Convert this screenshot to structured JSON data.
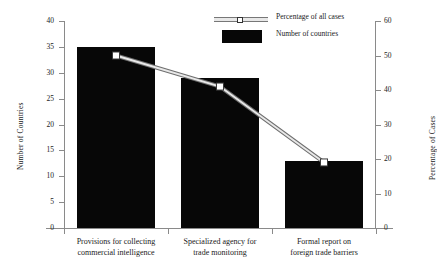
{
  "chart_data": {
    "type": "bar",
    "title": "",
    "subtitle": "",
    "xlabel": "",
    "ylabel": "Number of Countries",
    "y2label": "Percentage of Cases",
    "categories": [
      "Provisions for collecting commercial intelligence",
      "Specialized agency for trade monitoring",
      "Formal report on foreign trade barriers"
    ],
    "category_lines": [
      [
        "Provisions for collecting",
        "commercial intelligence"
      ],
      [
        "Specialized agency for",
        "trade monitoring"
      ],
      [
        "Formal report on",
        "foreign trade barriers"
      ]
    ],
    "series": [
      {
        "name": "Number of countries",
        "type": "bar",
        "axis": "left",
        "values": [
          35,
          29,
          13
        ],
        "color": "#070707"
      },
      {
        "name": "Percentage of all cases",
        "type": "line",
        "axis": "right",
        "values": [
          50,
          41,
          19
        ],
        "color": "#e8e8e8",
        "marker": "square-open"
      }
    ],
    "ylim": [
      0,
      40
    ],
    "yticks": [
      0,
      5,
      10,
      15,
      20,
      25,
      30,
      35,
      40
    ],
    "y2lim": [
      0,
      60
    ],
    "y2ticks": [
      0,
      10,
      20,
      30,
      40,
      50,
      60
    ],
    "grid": false,
    "legend_position": "top-center"
  },
  "legend": {
    "items": [
      {
        "label": "Percentage of all cases",
        "marker": "line-with-open-square-marker"
      },
      {
        "label": "Number of countries",
        "marker": "filled-black-rectangle"
      }
    ]
  },
  "axes": {
    "left_title": "Number of Countries",
    "right_title": "Percentage of Cases",
    "left_ticks": [
      "0",
      "5",
      "10",
      "15",
      "20",
      "25",
      "30",
      "35",
      "40"
    ],
    "right_ticks": [
      "0",
      "10",
      "20",
      "30",
      "40",
      "50",
      "60"
    ]
  }
}
